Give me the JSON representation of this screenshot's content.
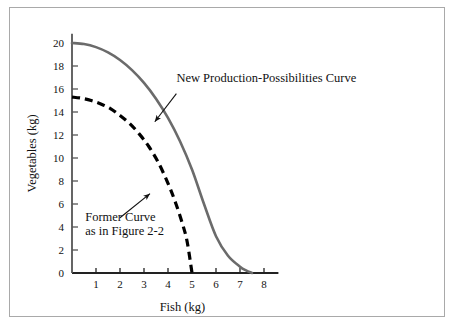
{
  "figure": {
    "background_color": "#ffffff",
    "frame_color": "#a9a9a9"
  },
  "chart_data": {
    "type": "line",
    "title": "",
    "xlabel": "Fish (kg)",
    "ylabel": "Vegetables (kg)",
    "xlim": [
      0,
      8.6
    ],
    "ylim": [
      0,
      20.8
    ],
    "xticks": [
      1,
      2,
      3,
      4,
      5,
      6,
      7,
      8
    ],
    "xtick_labels": [
      "1",
      "2",
      "3",
      "4",
      "5",
      "6",
      "7",
      "8"
    ],
    "yticks": [
      0,
      2,
      4,
      6,
      8,
      10,
      12,
      14,
      16,
      18,
      20
    ],
    "ytick_labels": [
      "0",
      "2",
      "4",
      "6",
      "8",
      "10",
      "12",
      "14",
      "16",
      "18",
      "20"
    ],
    "grid": false,
    "legend_position": "none",
    "series": [
      {
        "name": "New Production-Possibilities Curve",
        "style": "solid",
        "color": "#6b6b6b",
        "line_width": 2.6,
        "x": [
          0.0,
          0.5,
          1.0,
          1.5,
          2.0,
          2.5,
          3.0,
          3.5,
          4.0,
          4.5,
          5.0,
          5.5,
          6.0,
          6.5,
          7.0,
          7.25,
          7.5
        ],
        "y": [
          20.0,
          19.91,
          19.64,
          19.18,
          18.52,
          17.64,
          16.53,
          15.16,
          13.49,
          11.46,
          9.0,
          6.0,
          3.2,
          1.5,
          0.55,
          0.22,
          0.0
        ]
      },
      {
        "name": "Former Curve as in Figure 2-2",
        "style": "dashed",
        "color": "#000000",
        "line_width": 3.2,
        "dash_pattern": "8,5",
        "x": [
          0.0,
          0.4,
          0.8,
          1.2,
          1.6,
          2.0,
          2.4,
          2.8,
          3.2,
          3.6,
          4.0,
          4.3,
          4.6,
          4.8,
          5.0
        ],
        "y": [
          15.3,
          15.2,
          15.0,
          14.7,
          14.3,
          13.7,
          13.0,
          12.1,
          11.0,
          9.6,
          7.8,
          6.2,
          4.3,
          2.7,
          0.0
        ]
      }
    ],
    "annotations": [
      {
        "name": "new-curve-annotation",
        "lines": [
          "New Production-Possibilities Curve"
        ],
        "text_x": 4.35,
        "text_y": 16.6,
        "arrow_from_x": 4.35,
        "arrow_from_y": 15.6,
        "arrow_to_x": 3.45,
        "arrow_to_y": 13.15
      },
      {
        "name": "former-curve-annotation",
        "lines": [
          "Former Curve",
          "as in Figure 2-2"
        ],
        "text_x": 0.55,
        "text_y": 4.5,
        "arrow_from_x": 2.0,
        "arrow_from_y": 4.8,
        "arrow_to_x": 3.25,
        "arrow_to_y": 6.9
      }
    ]
  }
}
